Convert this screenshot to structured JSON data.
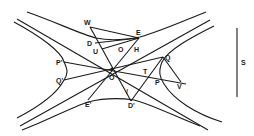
{
  "diagram": {
    "type": "conjugate-hyperbolas-geometry",
    "stroke_color": "#1a1a1a",
    "background": "#ffffff",
    "labels": {
      "W": "W",
      "E": "E",
      "D": "D",
      "U": "U",
      "O_small": "O",
      "H": "H",
      "P_prime": "P'",
      "Q_prime": "Q'",
      "O_center": "O",
      "T": "T",
      "Q": "Q",
      "P": "P",
      "V": "V",
      "E_prime": "E'",
      "D_prime": "D'",
      "slash": "/",
      "S": "S"
    },
    "scale_bar": {
      "label": "S"
    }
  }
}
